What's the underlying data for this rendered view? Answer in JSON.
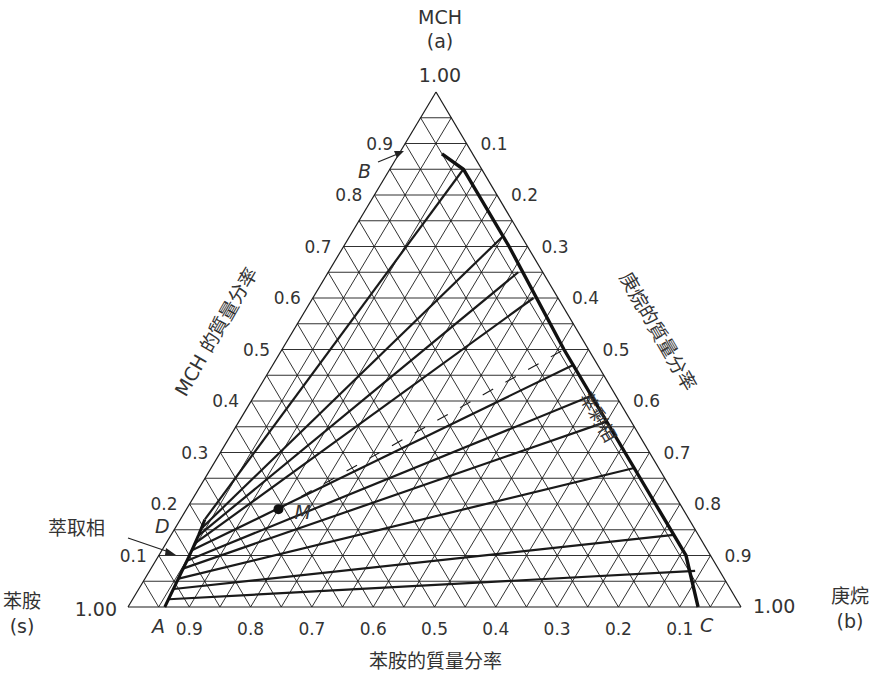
{
  "chart_data": {
    "type": "ternary",
    "title": "",
    "vertices": {
      "top": {
        "name": "MCH",
        "symbol": "(a)",
        "value_label": "1.00"
      },
      "left": {
        "name": "苯胺",
        "symbol": "(s)",
        "value_label": "1.00"
      },
      "right": {
        "name": "庚烷",
        "symbol": "(b)",
        "value_label": "1.00"
      }
    },
    "axes": {
      "left": {
        "label": "MCH 的質量分率",
        "ticks": [
          "0.9",
          "0.8",
          "0.7",
          "0.6",
          "0.5",
          "0.4",
          "0.3",
          "0.2",
          "0.1"
        ]
      },
      "right": {
        "label": "庚烷的質量分率",
        "ticks": [
          "0.1",
          "0.2",
          "0.3",
          "0.4",
          "0.5",
          "0.6",
          "0.7",
          "0.8",
          "0.9"
        ]
      },
      "bottom": {
        "label": "苯胺的質量分率",
        "ticks": [
          "0.9",
          "0.8",
          "0.7",
          "0.6",
          "0.5",
          "0.4",
          "0.3",
          "0.2",
          "0.1"
        ]
      }
    },
    "grid_step": 0.05,
    "point_labels": {
      "A": "A",
      "B": "B",
      "C": "C",
      "D": "D",
      "M": "M"
    },
    "phase_labels": {
      "extract": "萃取相",
      "raffinate": "萃剩相"
    },
    "points": {
      "A": {
        "a": 0.0,
        "b": 0.06
      },
      "B": {
        "a": 0.88,
        "b": 0.07
      },
      "C": {
        "a": 0.0,
        "b": 0.93
      },
      "D": {
        "a": 0.17,
        "b": 0.0
      },
      "M": {
        "a": 0.19,
        "b": 0.15
      }
    },
    "extract_curve": [
      {
        "a": 0.0,
        "b": 0.06
      },
      {
        "a": 0.05,
        "b": 0.055
      },
      {
        "a": 0.1,
        "b": 0.05
      },
      {
        "a": 0.14,
        "b": 0.045
      },
      {
        "a": 0.17,
        "b": 0.04
      }
    ],
    "raffinate_curve": [
      {
        "a": 0.88,
        "b": 0.07
      },
      {
        "a": 0.85,
        "b": 0.12
      },
      {
        "a": 0.7,
        "b": 0.27
      },
      {
        "a": 0.5,
        "b": 0.46
      },
      {
        "a": 0.35,
        "b": 0.61
      },
      {
        "a": 0.2,
        "b": 0.76
      },
      {
        "a": 0.1,
        "b": 0.86
      },
      {
        "a": 0.0,
        "b": 0.93
      }
    ],
    "tie_lines": [
      {
        "extract": {
          "a": 0.015,
          "b": 0.059
        },
        "raffinate": {
          "a": 0.07,
          "b": 0.89
        }
      },
      {
        "extract": {
          "a": 0.035,
          "b": 0.057
        },
        "raffinate": {
          "a": 0.14,
          "b": 0.82
        }
      },
      {
        "extract": {
          "a": 0.055,
          "b": 0.055
        },
        "raffinate": {
          "a": 0.27,
          "b": 0.69
        }
      },
      {
        "extract": {
          "a": 0.075,
          "b": 0.053
        },
        "raffinate": {
          "a": 0.36,
          "b": 0.6
        }
      },
      {
        "extract": {
          "a": 0.09,
          "b": 0.051
        },
        "raffinate": {
          "a": 0.41,
          "b": 0.55
        }
      },
      {
        "extract": {
          "a": 0.11,
          "b": 0.049
        },
        "raffinate": {
          "a": 0.47,
          "b": 0.49
        }
      },
      {
        "extract": {
          "a": 0.125,
          "b": 0.048
        },
        "raffinate": {
          "a": 0.6,
          "b": 0.36
        }
      },
      {
        "extract": {
          "a": 0.14,
          "b": 0.046
        },
        "raffinate": {
          "a": 0.65,
          "b": 0.31
        }
      },
      {
        "extract": {
          "a": 0.155,
          "b": 0.044
        },
        "raffinate": {
          "a": 0.72,
          "b": 0.25
        }
      },
      {
        "extract": {
          "a": 0.17,
          "b": 0.04
        },
        "raffinate": {
          "a": 0.85,
          "b": 0.12
        }
      }
    ],
    "dashed_line": {
      "from": {
        "a": 0.19,
        "b": 0.15
      },
      "to": {
        "a": 0.5,
        "b": 0.46
      }
    }
  }
}
